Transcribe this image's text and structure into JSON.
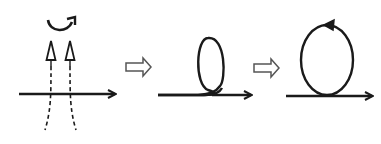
{
  "diagram": {
    "type": "process-sequence",
    "stages": [
      {
        "id": "stage-1",
        "description": "Horizontal arrow crossed by two vertical dashed lines with hollow upward arrowheads, curved rotation arrow above"
      },
      {
        "id": "stage-2",
        "description": "Horizontal line forming a twisted loop, arrow continuing to the right"
      },
      {
        "id": "stage-3",
        "description": "Closed loop sitting on a horizontal arrow, arrowhead on loop pointing left (counter-clockwise)"
      }
    ],
    "transitions": [
      "hollow-right-arrow",
      "hollow-right-arrow"
    ],
    "colors": {
      "stroke": "#1a1a1a",
      "background": "#ffffff"
    }
  }
}
